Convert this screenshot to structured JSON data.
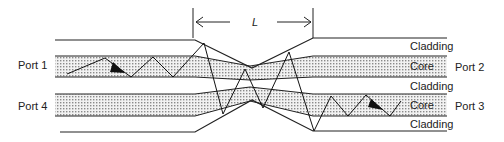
{
  "diagram": {
    "type": "fused fiber directional coupler",
    "length_label": "L",
    "ports": {
      "port1": "Port 1",
      "port2": "Port 2",
      "port3": "Port 3",
      "port4": "Port 4"
    },
    "layers": {
      "cladding_top": "Cladding",
      "core_top": "Core",
      "cladding_mid": "Cladding",
      "core_bottom": "Core",
      "cladding_bottom": "Cladding"
    },
    "colors": {
      "line": "#222222",
      "core_fill": "#c8c8c8",
      "background": "#ffffff"
    }
  }
}
